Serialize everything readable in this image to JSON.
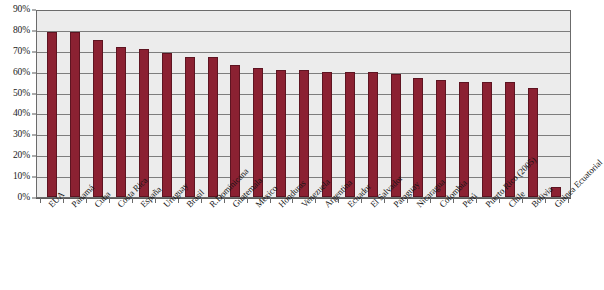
{
  "chart_data": {
    "type": "bar",
    "title": "",
    "subtitle": "",
    "xlabel": "",
    "ylabel": "",
    "ylim": [
      0,
      90
    ],
    "ytick_labels": [
      "90%",
      "80%",
      "70%",
      "60%",
      "50%",
      "40%",
      "30%",
      "20%",
      "10%",
      "0%"
    ],
    "ytick_values": [
      90,
      80,
      70,
      60,
      50,
      40,
      30,
      20,
      10,
      0
    ],
    "grid": true,
    "legend": "none",
    "series_name": "",
    "bar_color": "#8b2132",
    "bar_border_color": "#5e1421",
    "plot_background": "#ececec",
    "gridline_color": "#7d7d7d",
    "axis_color": "#5a5a5a",
    "categories": [
      "EUA",
      "Panamá",
      "Cuba",
      "Costa Rica",
      "España",
      "Uruguay",
      "Brasil",
      "R.Dominicana",
      "Guatemala",
      "México",
      "Honduras",
      "Venezuela",
      "Argentina",
      "Ecuador",
      "El Salvador",
      "Paraguay",
      "Nicaragua",
      "Colombia",
      "Perú",
      "Puerto Rico (2005)",
      "Chile",
      "Bolivia",
      "Guinea Ecuatorial"
    ],
    "values": [
      79,
      79,
      75,
      72,
      71,
      69,
      67,
      67,
      63,
      62,
      61,
      61,
      60,
      60,
      60,
      59,
      57,
      56,
      55,
      55,
      55,
      52,
      5
    ]
  }
}
